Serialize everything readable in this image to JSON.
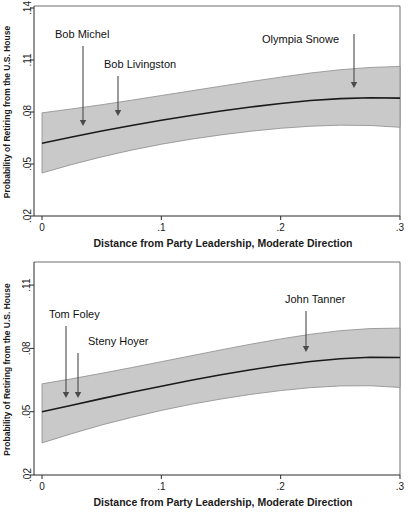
{
  "figure": {
    "background_color": "#ffffff",
    "band_color": "#c9c9c9",
    "line_color": "#1a1a1a",
    "arrow_color": "#4a4a4a"
  },
  "chart_data": [
    {
      "id": "republicans-panel",
      "type": "line",
      "title": "",
      "xlabel": "Distance from Party Leadership, Moderate Direction",
      "ylabel": "Probability of Retiring from the U.S. House",
      "xlim": [
        0,
        0.3
      ],
      "ylim": [
        0.02,
        0.14
      ],
      "xticks": [
        0,
        0.1,
        0.2,
        0.3
      ],
      "xticklabels": [
        "0",
        ".1",
        ".2",
        ".3"
      ],
      "yticks": [
        0.02,
        0.05,
        0.08,
        0.11,
        0.14
      ],
      "yticklabels": [
        ".02",
        ".05",
        ".08",
        ".11",
        ".14"
      ],
      "grid": false,
      "legend": "none",
      "x": [
        0,
        0.025,
        0.05,
        0.075,
        0.1,
        0.125,
        0.15,
        0.175,
        0.2,
        0.225,
        0.25,
        0.275,
        0.3
      ],
      "series": [
        {
          "name": "Predicted probability",
          "values": [
            0.062,
            0.0656,
            0.069,
            0.0722,
            0.0752,
            0.078,
            0.0806,
            0.0829,
            0.0849,
            0.0866,
            0.0877,
            0.0882,
            0.088
          ]
        },
        {
          "name": "95% CI upper",
          "values": [
            0.0795,
            0.0818,
            0.0842,
            0.0868,
            0.0895,
            0.0922,
            0.0949,
            0.0976,
            0.1001,
            0.1025,
            0.1044,
            0.1057,
            0.1063
          ]
        },
        {
          "name": "95% CI lower",
          "values": [
            0.0448,
            0.0497,
            0.0541,
            0.058,
            0.0614,
            0.0643,
            0.0668,
            0.0689,
            0.0706,
            0.0718,
            0.0724,
            0.0722,
            0.0712
          ]
        }
      ],
      "annotations": [
        {
          "label": "Bob Michel",
          "label_x": 55,
          "label_y": 38,
          "arrow_x": 83,
          "arrow_y0": 46,
          "arrow_y1": 126
        },
        {
          "label": "Bob Livingston",
          "label_x": 104,
          "label_y": 68,
          "arrow_x": 118,
          "arrow_y0": 76,
          "arrow_y1": 116
        },
        {
          "label": "Olympia Snowe",
          "label_x": 262,
          "label_y": 43,
          "arrow_x": 354,
          "arrow_y0": 34,
          "arrow_y1": 88
        }
      ]
    },
    {
      "id": "democrats-panel",
      "type": "line",
      "title": "",
      "xlabel": "Distance from Party Leadership, Moderate Direction",
      "ylabel": "Probability of Retiring from the U.S. House",
      "xlim": [
        0,
        0.3
      ],
      "ylim": [
        0.02,
        0.12
      ],
      "xticks": [
        0,
        0.1,
        0.2,
        0.3
      ],
      "xticklabels": [
        "0",
        ".1",
        ".2",
        ".3"
      ],
      "yticks": [
        0.02,
        0.05,
        0.08,
        0.11
      ],
      "yticklabels": [
        ".02",
        ".05",
        ".08",
        ".11"
      ],
      "grid": false,
      "legend": "none",
      "x": [
        0,
        0.025,
        0.05,
        0.075,
        0.1,
        0.125,
        0.15,
        0.175,
        0.2,
        0.225,
        0.25,
        0.275,
        0.3
      ],
      "series": [
        {
          "name": "Predicted probability",
          "values": [
            0.05,
            0.0531,
            0.0562,
            0.0592,
            0.0621,
            0.0649,
            0.0675,
            0.0699,
            0.072,
            0.0738,
            0.0751,
            0.0758,
            0.0757
          ]
        },
        {
          "name": "95% CI upper",
          "values": [
            0.0632,
            0.0656,
            0.0682,
            0.0709,
            0.0737,
            0.0765,
            0.0793,
            0.082,
            0.0845,
            0.0867,
            0.0884,
            0.0894,
            0.0896
          ]
        },
        {
          "name": "95% CI lower",
          "values": [
            0.0352,
            0.0396,
            0.0437,
            0.0473,
            0.0506,
            0.0535,
            0.056,
            0.0582,
            0.06,
            0.0614,
            0.0622,
            0.0623,
            0.0615
          ]
        }
      ],
      "annotations": [
        {
          "label": "Tom Foley",
          "label_x": 49,
          "label_y": 318,
          "arrow_x": 66,
          "arrow_y0": 326,
          "arrow_y1": 398
        },
        {
          "label": "Steny Hoyer",
          "label_x": 88,
          "label_y": 345,
          "arrow_x": 78,
          "arrow_y0": 353,
          "arrow_y1": 398
        },
        {
          "label": "John Tanner",
          "label_x": 285,
          "label_y": 303,
          "arrow_x": 306,
          "arrow_y0": 311,
          "arrow_y1": 352
        }
      ]
    }
  ]
}
